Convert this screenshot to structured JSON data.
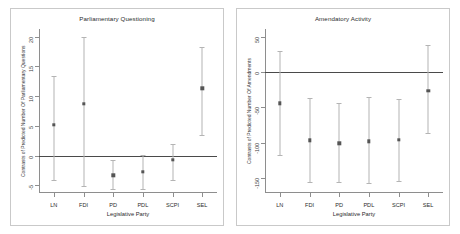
{
  "figure": {
    "width": 460,
    "height": 234,
    "background": "#ffffff",
    "panel_border_color": "#c9c9c9",
    "point_color": "#555555",
    "errorbar_color": "#b4b4b4",
    "zero_line_color": "#4a4a4a"
  },
  "chart_data": [
    {
      "type": "scatter",
      "title": "Parliamentary Questioning",
      "xlabel": "Legislative Party",
      "ylabel": "Contrasts of Predicted Number Of Parliamentary Questions",
      "categories": [
        "LN",
        "FDI",
        "PD",
        "PDL",
        "SCPI",
        "SEL"
      ],
      "values": [
        5.2,
        8.7,
        -3.3,
        -2.7,
        -0.7,
        11.3
      ],
      "ci_low": [
        -4.1,
        -5.1,
        -5.6,
        -5.6,
        -4.1,
        3.4
      ],
      "ci_high": [
        13.4,
        20.0,
        -0.8,
        0.1,
        1.9,
        18.2
      ],
      "ytick_labels": [
        "20",
        "15",
        "10",
        "5",
        "0",
        "-5"
      ],
      "ytick_values": [
        20,
        15,
        10,
        5,
        0,
        -5
      ],
      "ylim": [
        -6.3,
        21.3
      ],
      "grid": false,
      "legend": "none",
      "zero_reference_line": 0
    },
    {
      "type": "scatter",
      "title": "Amendatory Activity",
      "xlabel": "Legislative Party",
      "ylabel": "Contrasts of Predicted Number Of Amendments",
      "categories": [
        "LN",
        "FDI",
        "PD",
        "PDL",
        "SCPI",
        "SEL"
      ],
      "values": [
        -44,
        -97,
        -101,
        -98,
        -96,
        -26
      ],
      "ci_low": [
        -118,
        -157,
        -157,
        -158,
        -155,
        -86
      ],
      "ci_high": [
        31,
        -37,
        -44,
        -35,
        -38,
        39
      ],
      "ytick_labels": [
        "50",
        "0",
        "-50",
        "-100",
        "-150"
      ],
      "ytick_values": [
        50,
        0,
        -50,
        -100,
        -150
      ],
      "ylim": [
        -172,
        62
      ],
      "grid": false,
      "legend": "none",
      "zero_reference_line": 0
    }
  ]
}
